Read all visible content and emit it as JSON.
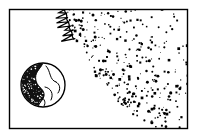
{
  "illustration": {
    "title": "Sun and Earth line illustration",
    "style": "black-and-white clip art / stipple engraving",
    "background_color": "#ffffff",
    "ink_color": "#000000",
    "frame": {
      "name": "picture-frame",
      "x": 9,
      "y": 9,
      "width": 179,
      "height": 120,
      "stroke_color": "#000000",
      "stroke_width": 1.4
    },
    "planet": {
      "name": "earth-globe",
      "label": "Earth",
      "center_x": 43,
      "center_y": 85,
      "radius": 22,
      "outline_color": "#000000",
      "shadow_side": "left",
      "shadow_fill": "#111111",
      "stipple_dots": 150,
      "continent_outlines": 5
    },
    "sun": {
      "name": "sun-fireball",
      "label": "Sun",
      "center_x": 243,
      "center_y": -28,
      "arc_radius": 182,
      "flame_teeth": 64,
      "flame_depth_min": 5,
      "flame_depth_max": 13,
      "corona_dots": 330,
      "arc_stroke_width": 1.3,
      "flame_stroke_width": 1.2,
      "entry_edge": "top",
      "exit_edge": "right"
    }
  }
}
